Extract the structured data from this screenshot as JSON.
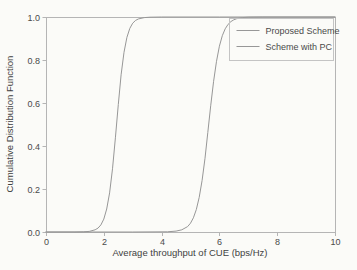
{
  "chart_data": {
    "type": "line",
    "title": "",
    "xlabel": "Average throughput of CUE (bps/Hz)",
    "ylabel": "Cumulative Distribution Function",
    "xlim": [
      0,
      10
    ],
    "ylim": [
      0.0,
      1.0
    ],
    "x_ticks": [
      0,
      2,
      4,
      6,
      8,
      10
    ],
    "x_tick_labels": [
      "0",
      "2",
      "4",
      "6",
      "8",
      "10"
    ],
    "y_ticks": [
      0.0,
      0.2,
      0.4,
      0.6,
      0.8,
      1.0
    ],
    "y_tick_labels": [
      "0.0",
      "0.2",
      "0.4",
      "0.6",
      "0.8",
      "1.0"
    ],
    "grid": false,
    "legend_position": "upper right",
    "series": [
      {
        "name": "Proposed Scheme",
        "color": "#979797",
        "x": [
          0,
          3.0,
          4.2,
          4.5,
          4.7,
          4.9,
          5.0,
          5.1,
          5.2,
          5.3,
          5.4,
          5.5,
          5.6,
          5.7,
          5.8,
          5.9,
          6.0,
          6.1,
          6.2,
          6.3,
          6.4,
          6.5,
          6.6,
          6.8,
          7.0,
          7.5,
          10.0
        ],
        "y": [
          0,
          0,
          0.001,
          0.004,
          0.01,
          0.025,
          0.041,
          0.066,
          0.104,
          0.161,
          0.24,
          0.343,
          0.463,
          0.587,
          0.701,
          0.794,
          0.864,
          0.913,
          0.945,
          0.966,
          0.979,
          0.987,
          0.992,
          0.997,
          0.999,
          1.0,
          1.0
        ]
      },
      {
        "name": "Scheme with PC",
        "color": "#979797",
        "x": [
          0,
          1.0,
          1.3,
          1.5,
          1.7,
          1.8,
          1.9,
          2.0,
          2.1,
          2.2,
          2.3,
          2.4,
          2.5,
          2.6,
          2.7,
          2.8,
          2.9,
          3.0,
          3.1,
          3.2,
          3.4,
          3.6,
          4.0,
          6.0,
          10.0
        ],
        "y": [
          0,
          0,
          0.001,
          0.003,
          0.01,
          0.018,
          0.033,
          0.06,
          0.107,
          0.182,
          0.294,
          0.438,
          0.593,
          0.731,
          0.836,
          0.905,
          0.947,
          0.971,
          0.984,
          0.991,
          0.997,
          0.999,
          1.0,
          1.0,
          1.0
        ]
      }
    ]
  },
  "colors": {
    "background": "#fbfbf8",
    "axis": "#b5b5b5",
    "curve": "#979797",
    "text": "#4a4a4a",
    "legend_border": "#c4c4c4"
  }
}
